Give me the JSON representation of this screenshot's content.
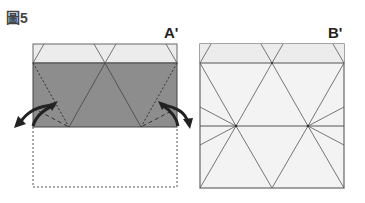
{
  "figure": {
    "title": "圖5"
  },
  "panels": [
    {
      "label": "A'",
      "description": "Folded paper: light top band, dark folded section with dashed fold lines and curved arrows, dashed outline of unfolded bottom half"
    },
    {
      "label": "B'",
      "description": "Unfolded square paper showing crease pattern of triangles with two radial vertex points"
    }
  ],
  "colors": {
    "light_fill": "#ebebeb",
    "dark_fill": "#8a8a8a",
    "line": "#555555",
    "arrow": "#2a2a2a",
    "white_fill": "#f4f4f4"
  }
}
